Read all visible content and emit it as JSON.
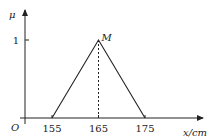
{
  "chart_data": {
    "type": "line",
    "title": "",
    "xlabel": "x/cm",
    "ylabel": "μ",
    "origin_label": "O",
    "x_ticks": [
      155,
      165,
      175
    ],
    "y_ticks": [
      1
    ],
    "xlim": [
      149.5,
      187
    ],
    "ylim": [
      0,
      1.4
    ],
    "series": [
      {
        "name": "membership",
        "x": [
          155,
          165,
          175
        ],
        "y": [
          0,
          1,
          0
        ]
      }
    ],
    "annotations": [
      {
        "text": "M",
        "x": 165,
        "y": 1,
        "style": "point-label"
      },
      {
        "type": "dashed-vertical",
        "x": 165,
        "from_y": 0,
        "to_y": 1
      }
    ],
    "grid": false
  }
}
